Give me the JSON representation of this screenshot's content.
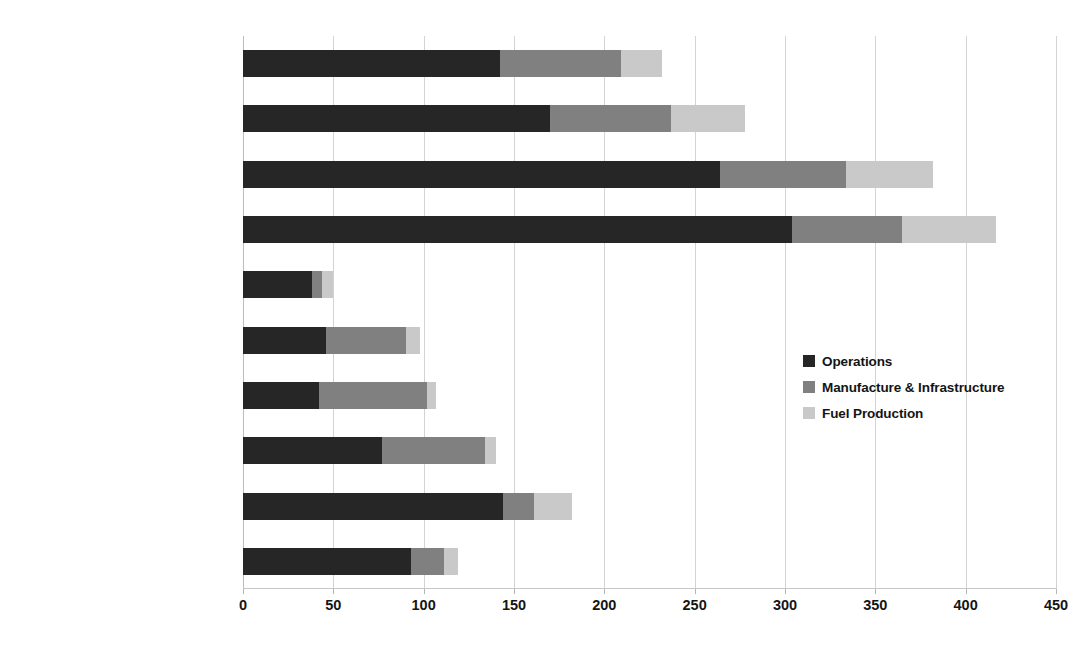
{
  "chart_data": {
    "type": "bar",
    "orientation": "horizontal",
    "stacked": true,
    "title": "",
    "xlabel": "",
    "ylabel": "",
    "xlim": [
      0,
      450
    ],
    "xticks": [
      0,
      50,
      100,
      150,
      200,
      250,
      300,
      350,
      400,
      450
    ],
    "grid": true,
    "legend_position": "middle-right",
    "categories": [
      "Gasoline Sedan",
      "Gasoline SUV",
      "Gasoline Pickup",
      "Urban Diesel Bus (Off Peak)",
      "Urban Diesel Bus (Peak)",
      "Commuter Rail (SF Caltrain)",
      "Light Rail (SF Muni)",
      "Light Rail (Boston Green Line)",
      "Small Aircraft",
      "Large Aircraft"
    ],
    "series": [
      {
        "name": "Operations",
        "color": "#262626",
        "values": [
          142,
          170,
          264,
          304,
          38,
          46,
          42,
          77,
          144,
          93
        ]
      },
      {
        "name": "Manufacture & Infrastructure",
        "color": "#808080",
        "values": [
          67,
          67,
          70,
          61,
          6,
          44,
          60,
          57,
          17,
          18
        ]
      },
      {
        "name": "Fuel Production",
        "color": "#c9c9c9",
        "values": [
          23,
          41,
          48,
          52,
          6,
          8,
          5,
          6,
          21,
          8
        ]
      }
    ],
    "totals": [
      232,
      278,
      382,
      417,
      50,
      98,
      107,
      140,
      182,
      119
    ]
  }
}
